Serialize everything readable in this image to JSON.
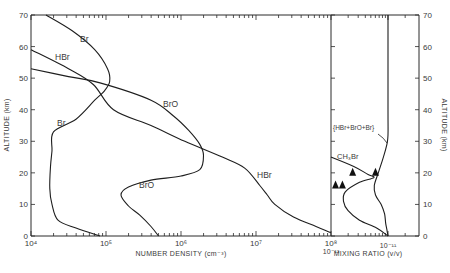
{
  "chart_data": [
    {
      "type": "line",
      "panel": "left",
      "xlabel": "NUMBER DENSITY (cm⁻³)",
      "ylabel": "ALTITUDE (km)",
      "xscale": "log",
      "xlim": [
        10000.0,
        100000000.0
      ],
      "ylim": [
        0,
        70
      ],
      "x_tick_labels": [
        "10⁴",
        "10⁵",
        "10⁶",
        "10⁷",
        "10⁸"
      ],
      "x_tick_values": [
        10000.0,
        100000.0,
        1000000.0,
        10000000.0,
        100000000.0
      ],
      "y_tick_labels": [
        "0",
        "10",
        "20",
        "30",
        "40",
        "50",
        "60",
        "70"
      ],
      "y_tick_values": [
        0,
        10,
        20,
        30,
        40,
        50,
        60,
        70
      ],
      "grid": false,
      "series": [
        {
          "name": "Br",
          "log10_density": [
            4.2,
            4.55,
            4.85,
            5.02,
            5.05,
            4.98,
            4.85,
            4.6,
            4.3,
            4.28,
            4.26,
            4.25,
            4.28,
            4.36,
            4.6,
            4.92
          ],
          "altitude_km": [
            70,
            65,
            59,
            53,
            49,
            46,
            43,
            37,
            33,
            27,
            22,
            15,
            10,
            5,
            2.5,
            0
          ]
        },
        {
          "name": "HBr",
          "log10_density": [
            4.0,
            4.5,
            4.83,
            5.1,
            5.6,
            6.05,
            6.55,
            6.85,
            7.05,
            7.15,
            7.25,
            7.5,
            7.8,
            8.0
          ],
          "altitude_km": [
            59,
            53,
            48,
            40,
            35,
            30,
            25,
            21.5,
            16,
            13,
            10,
            6,
            3,
            1
          ]
        },
        {
          "name": "BrO",
          "log10_density": [
            4.0,
            4.5,
            4.92,
            5.6,
            5.9,
            6.1,
            6.25,
            6.3,
            6.25,
            6.0,
            5.6,
            5.3,
            5.2,
            5.3,
            5.45,
            5.6,
            5.7
          ],
          "altitude_km": [
            53,
            50.5,
            48.5,
            43,
            38,
            33.5,
            29,
            25.5,
            21,
            19,
            17.7,
            15.5,
            13,
            9.5,
            6.6,
            3,
            0
          ]
        }
      ],
      "annotations": [
        {
          "text": "Br",
          "near_altitude_km": 62
        },
        {
          "text": "HBr",
          "near_altitude_km": 56
        },
        {
          "text": "BrO",
          "near_altitude_km": 40
        },
        {
          "text": "Br",
          "near_altitude_km": 35
        },
        {
          "text": "BrO",
          "near_altitude_km": 15
        },
        {
          "text": "HBr",
          "near_altitude_km": 23
        }
      ]
    },
    {
      "type": "line",
      "panel": "right",
      "xlabel": "MIXING RATIO (v/v)",
      "ylabel": "ALTITUDE (km)",
      "xscale": "log",
      "xlim": [
        1e-12,
        2.2e-11
      ],
      "ylim": [
        0,
        70
      ],
      "x_tick_labels": [
        "10⁻¹²",
        "10⁻¹¹"
      ],
      "x_tick_values": [
        1e-12,
        1e-11
      ],
      "y_tick_labels": [
        "0",
        "10",
        "20",
        "30",
        "40",
        "50",
        "60",
        "70"
      ],
      "y_tick_values": [
        0,
        10,
        20,
        30,
        40,
        50,
        60,
        70
      ],
      "grid": false,
      "series": [
        {
          "name": "(HBr+BrO+Br)",
          "log10_mixing_ratio": [
            -11.0,
            -11.0,
            -11.0,
            -11.02,
            -11.08,
            -11.17,
            -11.24,
            -11.22,
            -11.12,
            -11.06,
            -11.04,
            -11.02,
            -11.0
          ],
          "altitude_km": [
            70,
            40,
            32,
            29,
            25,
            20,
            16,
            13,
            10,
            7,
            4,
            2,
            0
          ]
        },
        {
          "name": "CH3Br",
          "log10_mixing_ratio": [
            -12.0,
            -11.6,
            -11.35,
            -11.25,
            -11.5,
            -11.75,
            -11.78,
            -11.7,
            -11.5,
            -11.2,
            -11.0
          ],
          "altitude_km": [
            25,
            22,
            19.5,
            18.5,
            17,
            14,
            11,
            8,
            5,
            2.5,
            0
          ]
        }
      ],
      "observations": {
        "marker": "triangle",
        "points": [
          {
            "log10_mixing_ratio": -11.92,
            "altitude_km": 16
          },
          {
            "log10_mixing_ratio": -11.8,
            "altitude_km": 16
          },
          {
            "log10_mixing_ratio": -11.62,
            "altitude_km": 20
          },
          {
            "log10_mixing_ratio": -11.22,
            "altitude_km": 20
          }
        ]
      },
      "annotations": [
        {
          "text": "{HBr+BrO+Br}",
          "near_altitude_km": 36
        },
        {
          "text": "CH₃Br",
          "near_altitude_km": 24
        }
      ]
    }
  ]
}
